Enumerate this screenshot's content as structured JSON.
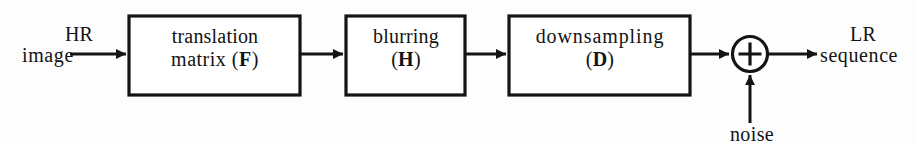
{
  "diagram": {
    "type": "block-diagram",
    "background_color": "#fdfdfd",
    "stroke_color": "#141414",
    "text_color": "#131313",
    "input": {
      "line1": "HR",
      "line2": "image"
    },
    "output": {
      "line1": "LR",
      "line2": "sequence"
    },
    "noise": {
      "label": "noise"
    },
    "summation": {
      "symbol": "+"
    },
    "blocks": [
      {
        "id": "translation-matrix",
        "line1": "translation",
        "line2": "matrix (",
        "operator": "F",
        "line2_suffix": ")"
      },
      {
        "id": "blurring",
        "line1": "blurring",
        "line2": "(",
        "operator": "H",
        "line2_suffix": ")"
      },
      {
        "id": "downsampling",
        "line1": "downsampling",
        "line2": "(",
        "operator": "D",
        "line2_suffix": ")"
      }
    ]
  }
}
